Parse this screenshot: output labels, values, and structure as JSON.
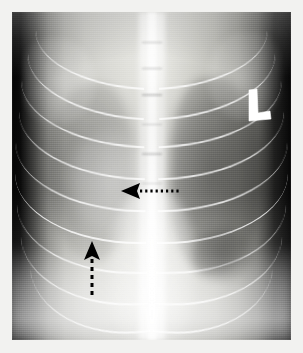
{
  "image": {
    "kind": "radiograph",
    "modality": "X-ray",
    "view": "ventrodorsal-thorax",
    "width": 303,
    "height": 353,
    "border_color": "#f2f2f0",
    "background_color": "#050505"
  },
  "annotations": {
    "side_marker": {
      "label": "L",
      "name": "left-side-marker",
      "color": "#ffffff",
      "x": 246,
      "y": 88,
      "width": 26,
      "height": 34
    },
    "arrows": [
      {
        "name": "horizontal-dotted-arrow",
        "direction": "left",
        "style": "dotted",
        "color": "#000000",
        "x": 120,
        "y": 180,
        "length": 62,
        "dot_count": 9
      },
      {
        "name": "vertical-dashed-arrow",
        "direction": "up",
        "style": "dashed",
        "color": "#000000",
        "x": 80,
        "y": 240,
        "length": 60,
        "dash_count": 5
      }
    ]
  },
  "anatomy": {
    "spine_label": "thoracic-spine",
    "lung_right_label": "right-lung-field",
    "lung_left_label": "left-lung-field",
    "opacity_label": "right-cranial-lung-opacity",
    "mediastinum_label": "cardiac-silhouette",
    "rib_count_visible": 9
  }
}
